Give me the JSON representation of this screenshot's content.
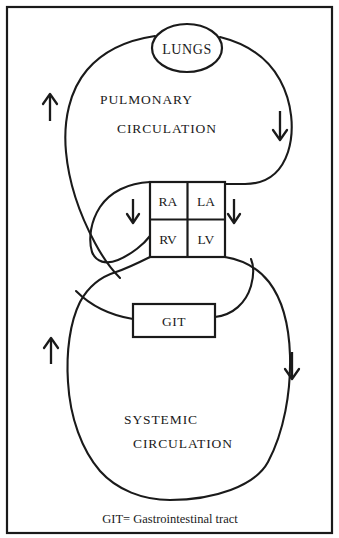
{
  "figure": {
    "type": "diagram",
    "frame": {
      "border_color": "#1a1a1a"
    },
    "nodes": [
      {
        "id": "lungs",
        "label": "LUNGS",
        "shape": "ellipse"
      },
      {
        "id": "heart",
        "label": "HEART",
        "shape": "grid-box",
        "cells": [
          {
            "id": "ra",
            "label": "RA"
          },
          {
            "id": "la",
            "label": "LA"
          },
          {
            "id": "rv",
            "label": "RV"
          },
          {
            "id": "lv",
            "label": "LV"
          }
        ]
      },
      {
        "id": "git",
        "label": "GIT",
        "shape": "rect"
      }
    ],
    "loops": [
      {
        "id": "pulmonary",
        "label_line1": "PULMONARY",
        "label_line2": "CIRCULATION"
      },
      {
        "id": "systemic",
        "label_line1": "SYSTEMIC",
        "label_line2": "CIRCULATION"
      }
    ],
    "arrows": [
      {
        "id": "pulmonary-left-up",
        "glyph": "up",
        "direction": "up"
      },
      {
        "id": "pulmonary-right-down",
        "glyph": "down",
        "direction": "down"
      },
      {
        "id": "heart-left-down",
        "glyph": "down",
        "direction": "down"
      },
      {
        "id": "heart-right-down",
        "glyph": "down",
        "direction": "down"
      },
      {
        "id": "systemic-left-up",
        "glyph": "up",
        "direction": "up"
      },
      {
        "id": "systemic-right-down",
        "glyph": "down",
        "direction": "down"
      }
    ],
    "caption": "GIT= Gastrointestinal tract",
    "colors": {
      "ink": "#1a1a1a",
      "paper": "#ffffff"
    }
  }
}
